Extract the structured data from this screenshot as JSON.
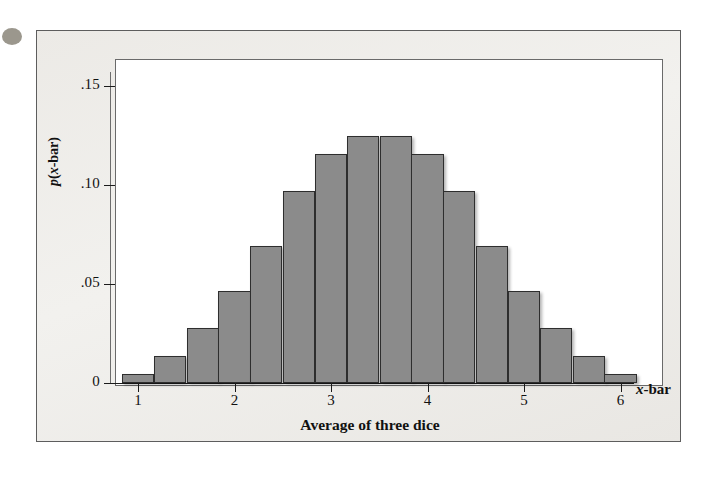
{
  "figure": {
    "caption_dot": "page-bullet"
  },
  "chart_data": {
    "type": "bar",
    "title": "",
    "xlabel": "Average of three dice",
    "ylabel": "p(x-bar)",
    "x_variable_label": "x-bar",
    "categories": [
      "1.00",
      "1.33",
      "1.67",
      "2.00",
      "2.33",
      "2.67",
      "3.00",
      "3.33",
      "3.67",
      "4.00",
      "4.33",
      "4.67",
      "5.00",
      "5.33",
      "5.67",
      "6.00"
    ],
    "values": [
      0.0046,
      0.0139,
      0.0278,
      0.0463,
      0.0694,
      0.0972,
      0.1157,
      0.125,
      0.125,
      0.1157,
      0.0972,
      0.0694,
      0.0463,
      0.0278,
      0.0139,
      0.0046
    ],
    "bar_color": "#8b8b8b",
    "bar_edge_color": "#2e2e2e",
    "xlim": [
      0.833,
      6.167
    ],
    "ylim": [
      0,
      0.158
    ],
    "grid": false,
    "legend": false,
    "xticks": [
      1,
      2,
      3,
      4,
      5,
      6
    ],
    "xtick_labels": [
      "1",
      "2",
      "3",
      "4",
      "5",
      "6"
    ],
    "yticks": [
      0,
      0.05,
      0.1,
      0.15
    ],
    "ytick_labels": [
      "0",
      ".05",
      ".10",
      ".15"
    ]
  }
}
